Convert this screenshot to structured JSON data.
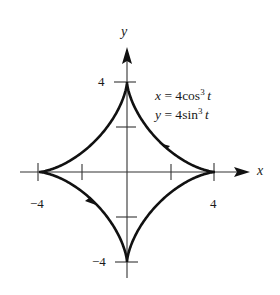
{
  "figure": {
    "equations": {
      "x": {
        "lhs": "x",
        "eq": " = 4",
        "fn": "cos",
        "exp": "3",
        "var": "t"
      },
      "y": {
        "lhs": "y",
        "eq": " = 4",
        "fn": "sin",
        "exp": "3",
        "var": "t"
      }
    },
    "axes": {
      "x_label": "x",
      "y_label": "y",
      "x_ticks": {
        "neg": "−4",
        "pos": "4"
      },
      "y_ticks": {
        "pos": "4",
        "neg": "−4"
      }
    },
    "colors": {
      "curve": "#111111",
      "axis": "#333333",
      "text": "#1a1a1a",
      "background": "#ffffff"
    },
    "curve": {
      "name": "astroid",
      "orientation": "counterclockwise",
      "cusps": [
        [
          4,
          0
        ],
        [
          0,
          4
        ],
        [
          -4,
          0
        ],
        [
          0,
          -4
        ]
      ]
    }
  }
}
